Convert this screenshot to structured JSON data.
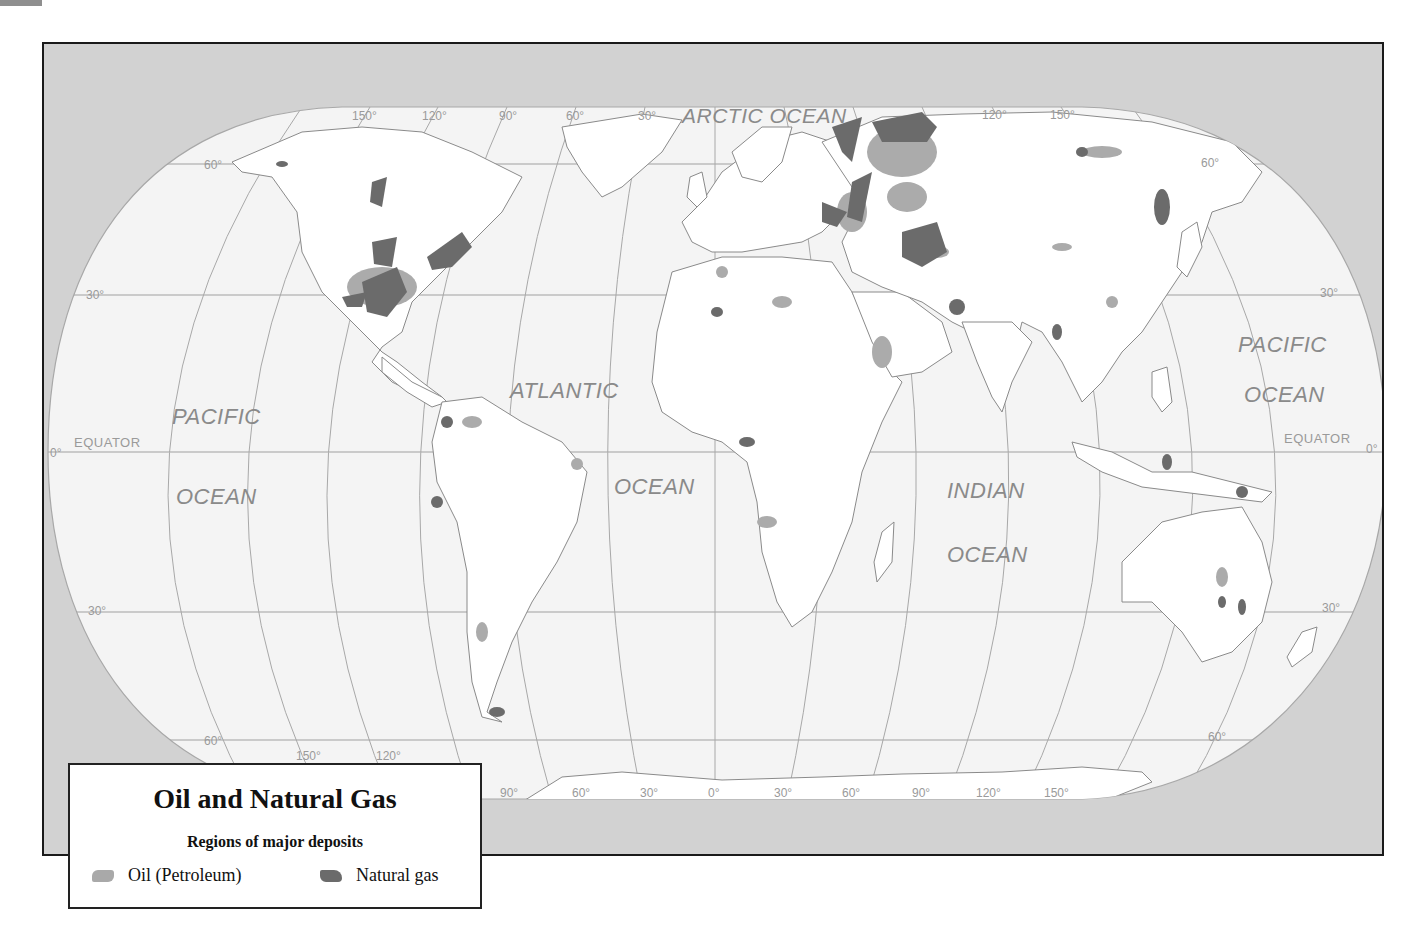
{
  "map": {
    "title": "Oil and Natural Gas",
    "subtitle": "Regions of major deposits",
    "colors": {
      "frame_bg": "#d2d2d2",
      "land": "#ffffff",
      "ocean": "#f3f3f3",
      "oil": "#a9a9a9",
      "natural_gas": "#6b6b6b",
      "gridline": "#9c9c9c",
      "label": "#8a8a8a"
    },
    "legend": {
      "items": [
        {
          "label": "Oil (Petroleum)",
          "color": "#a9a9a9",
          "icon": "oil-swatch-icon"
        },
        {
          "label": "Natural gas",
          "color": "#6b6b6b",
          "icon": "gas-swatch-icon"
        }
      ]
    },
    "oceans": [
      {
        "name": "ARCTIC OCEAN"
      },
      {
        "name": "PACIFIC"
      },
      {
        "name": "OCEAN"
      },
      {
        "name": "ATLANTIC"
      },
      {
        "name": "OCEAN"
      },
      {
        "name": "INDIAN"
      },
      {
        "name": "OCEAN"
      },
      {
        "name": "PACIFIC"
      },
      {
        "name": "OCEAN"
      }
    ],
    "equator_label": "EQUATOR",
    "latitude_labels": {
      "north_60_left": "60°",
      "north_60_right": "60°",
      "north_30_left": "30°",
      "north_30_right": "30°",
      "equator_left": "0°",
      "equator_right": "0°",
      "south_30_left": "30°",
      "south_30_right": "30°",
      "south_60_left": "60°",
      "south_60_right": "60°"
    },
    "longitude_labels_top": [
      "150°",
      "120°",
      "90°",
      "60°",
      "30°",
      "120°",
      "150°"
    ],
    "longitude_labels_bottom": [
      "150°",
      "120°",
      "90°",
      "60°",
      "30°",
      "0°",
      "30°",
      "60°",
      "90°",
      "120°",
      "150°"
    ]
  }
}
